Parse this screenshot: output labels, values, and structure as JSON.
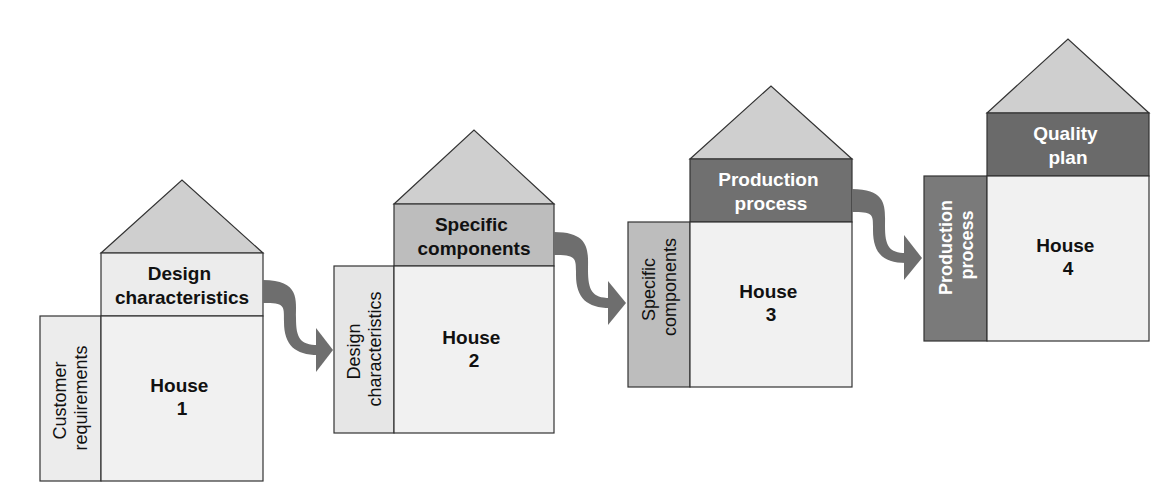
{
  "diagram": {
    "type": "house-of-quality-cascade",
    "colors": {
      "roof": "#cfcfcf",
      "outline": "#333333",
      "light_fill": "#ececec",
      "main_fill": "#f1f1f1",
      "mid_fill": "#bdbdbd",
      "dark_fill": "#707070",
      "arrow": "#6e6e6e"
    },
    "houses": [
      {
        "title": "House",
        "number": "1",
        "top_label": [
          "Design",
          "characteristics"
        ],
        "side_label": [
          "Customer",
          "requirements"
        ]
      },
      {
        "title": "House",
        "number": "2",
        "top_label": [
          "Specific",
          "components"
        ],
        "side_label": [
          "Design",
          "characteristics"
        ]
      },
      {
        "title": "House",
        "number": "3",
        "top_label": [
          "Production",
          "process"
        ],
        "side_label": [
          "Specific",
          "components"
        ]
      },
      {
        "title": "House",
        "number": "4",
        "top_label": [
          "Quality",
          "plan"
        ],
        "side_label": [
          "Production",
          "process"
        ]
      }
    ]
  }
}
